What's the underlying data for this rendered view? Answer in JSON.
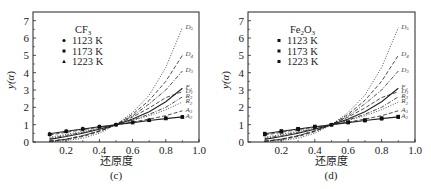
{
  "chart_data": [
    {
      "type": "line",
      "panel": "(c)",
      "legend_title": "CF3",
      "legend_title_main": "CF",
      "legend_title_sub": "3",
      "legend": [
        {
          "label": "1123 K",
          "marker": "circle"
        },
        {
          "label": "1173 K",
          "marker": "square"
        },
        {
          "label": "1223 K",
          "marker": "triangle"
        }
      ],
      "xlabel": "还原度",
      "ylabel": "y(α)",
      "xlim": [
        0,
        1.0
      ],
      "ylim": [
        0,
        7
      ],
      "xticks": [
        "0.2",
        "0.4",
        "0.6",
        "0.8",
        "1.0"
      ],
      "yticks": [
        "0",
        "1",
        "2",
        "3",
        "4",
        "5",
        "6",
        "7"
      ],
      "x": [
        0.1,
        0.2,
        0.3,
        0.4,
        0.5,
        0.6,
        0.7,
        0.8,
        0.9
      ],
      "series": [
        {
          "name": "D5",
          "label_main": "D",
          "label_sub": "5",
          "style": "dot",
          "values": [
            0.02,
            0.08,
            0.22,
            0.5,
            1.0,
            1.7,
            2.7,
            4.3,
            6.6
          ]
        },
        {
          "name": "D4",
          "label_main": "D",
          "label_sub": "4",
          "style": "dash",
          "values": [
            0.04,
            0.14,
            0.32,
            0.6,
            1.0,
            1.6,
            2.4,
            3.5,
            5.0
          ]
        },
        {
          "name": "D3",
          "label_main": "D",
          "label_sub": "3",
          "style": "dashdot",
          "values": [
            0.05,
            0.17,
            0.37,
            0.64,
            1.0,
            1.5,
            2.2,
            3.0,
            4.1
          ]
        },
        {
          "name": "F1",
          "label_main": "F",
          "label_sub": "1",
          "style": "solid",
          "values": [
            0.15,
            0.32,
            0.51,
            0.74,
            1.0,
            1.32,
            1.74,
            2.32,
            3.1
          ]
        },
        {
          "name": "D1",
          "label_main": "D",
          "label_sub": "1",
          "style": "dash",
          "values": [
            0.04,
            0.16,
            0.36,
            0.64,
            1.0,
            1.44,
            1.96,
            2.56,
            2.9
          ]
        },
        {
          "name": "R3",
          "label_main": "R",
          "label_sub": "3",
          "style": "dashdot",
          "values": [
            0.2,
            0.38,
            0.56,
            0.77,
            1.0,
            1.27,
            1.6,
            2.0,
            2.6
          ]
        },
        {
          "name": "R2",
          "label_main": "R",
          "label_sub": "2",
          "style": "dot",
          "values": [
            0.27,
            0.44,
            0.61,
            0.8,
            1.0,
            1.24,
            1.52,
            1.86,
            2.3
          ]
        },
        {
          "name": "A3",
          "label_main": "A",
          "label_sub": "3",
          "style": "dash",
          "values": [
            0.4,
            0.56,
            0.71,
            0.86,
            1.0,
            1.15,
            1.32,
            1.52,
            1.8
          ]
        },
        {
          "name": "A2",
          "label_main": "A",
          "label_sub": "2",
          "style": "solid",
          "values": [
            0.48,
            0.62,
            0.75,
            0.88,
            1.0,
            1.12,
            1.24,
            1.35,
            1.45
          ]
        }
      ],
      "experimental": [
        {
          "name": "1123 K",
          "values": [
            0.42,
            0.6,
            0.74,
            0.88,
            1.0,
            1.14,
            1.26,
            1.38,
            1.46
          ]
        },
        {
          "name": "1173 K",
          "values": [
            0.45,
            0.62,
            0.76,
            0.89,
            1.0,
            1.13,
            1.25,
            1.37,
            1.45
          ]
        },
        {
          "name": "1223 K",
          "values": [
            0.48,
            0.64,
            0.78,
            0.9,
            1.0,
            1.12,
            1.24,
            1.35,
            1.44
          ]
        }
      ],
      "grid": false,
      "legend_position": "upper left"
    },
    {
      "type": "line",
      "panel": "(d)",
      "legend_title": "Fe2O3",
      "legend_title_main": "Fe",
      "legend_title_sub": "2",
      "legend_title_main2": "O",
      "legend_title_sub2": "3",
      "legend": [
        {
          "label": "1123 K",
          "marker": "square"
        },
        {
          "label": "1173 K",
          "marker": "square"
        },
        {
          "label": "1223 K",
          "marker": "square"
        }
      ],
      "xlabel": "还原度",
      "ylabel": "y(α)",
      "xlim": [
        0,
        1.0
      ],
      "ylim": [
        0,
        7
      ],
      "xticks": [
        "0.2",
        "0.4",
        "0.6",
        "0.8",
        "1.0"
      ],
      "yticks": [
        "0",
        "1",
        "2",
        "3",
        "4",
        "5",
        "6",
        "7"
      ],
      "x": [
        0.1,
        0.2,
        0.3,
        0.4,
        0.5,
        0.6,
        0.7,
        0.8,
        0.9
      ],
      "series": [
        {
          "name": "D5",
          "label_main": "D",
          "label_sub": "5",
          "style": "dot",
          "values": [
            0.02,
            0.08,
            0.22,
            0.5,
            1.0,
            1.7,
            2.7,
            4.3,
            6.6
          ]
        },
        {
          "name": "D4",
          "label_main": "D",
          "label_sub": "4",
          "style": "dash",
          "values": [
            0.04,
            0.14,
            0.32,
            0.6,
            1.0,
            1.6,
            2.4,
            3.5,
            5.0
          ]
        },
        {
          "name": "D3",
          "label_main": "D",
          "label_sub": "3",
          "style": "dashdot",
          "values": [
            0.05,
            0.17,
            0.37,
            0.64,
            1.0,
            1.5,
            2.2,
            3.0,
            4.1
          ]
        },
        {
          "name": "F1",
          "label_main": "F",
          "label_sub": "1",
          "style": "solid",
          "values": [
            0.15,
            0.32,
            0.51,
            0.74,
            1.0,
            1.32,
            1.74,
            2.32,
            3.1
          ]
        },
        {
          "name": "D1",
          "label_main": "D",
          "label_sub": "1",
          "style": "dash",
          "values": [
            0.04,
            0.16,
            0.36,
            0.64,
            1.0,
            1.44,
            1.96,
            2.56,
            2.9
          ]
        },
        {
          "name": "R3",
          "label_main": "R",
          "label_sub": "3",
          "style": "dashdot",
          "values": [
            0.2,
            0.38,
            0.56,
            0.77,
            1.0,
            1.27,
            1.6,
            2.0,
            2.6
          ]
        },
        {
          "name": "R2",
          "label_main": "R",
          "label_sub": "2",
          "style": "dot",
          "values": [
            0.27,
            0.44,
            0.61,
            0.8,
            1.0,
            1.24,
            1.52,
            1.86,
            2.3
          ]
        },
        {
          "name": "A3",
          "label_main": "A",
          "label_sub": "3",
          "style": "dash",
          "values": [
            0.4,
            0.56,
            0.71,
            0.86,
            1.0,
            1.15,
            1.32,
            1.52,
            1.8
          ]
        },
        {
          "name": "A2",
          "label_main": "A",
          "label_sub": "2",
          "style": "solid",
          "values": [
            0.48,
            0.62,
            0.75,
            0.88,
            1.0,
            1.12,
            1.24,
            1.35,
            1.45
          ]
        }
      ],
      "experimental": [
        {
          "name": "1123 K",
          "values": [
            0.43,
            0.58,
            0.73,
            0.87,
            1.0,
            1.14,
            1.27,
            1.38,
            1.47
          ]
        },
        {
          "name": "1173 K",
          "values": [
            0.46,
            0.61,
            0.75,
            0.88,
            1.0,
            1.13,
            1.25,
            1.36,
            1.45
          ]
        },
        {
          "name": "1223 K",
          "values": [
            0.49,
            0.64,
            0.77,
            0.9,
            1.0,
            1.12,
            1.23,
            1.34,
            1.43
          ]
        }
      ],
      "grid": false,
      "legend_position": "upper left"
    }
  ],
  "panels": [
    {
      "id": "c",
      "caption": "(c)",
      "xlabel": "还原度",
      "ylabel_main": "y(",
      "ylabel_alpha": "α",
      "ylabel_close": ")"
    },
    {
      "id": "d",
      "caption": "(d)",
      "xlabel": "还原度",
      "ylabel_main": "y(",
      "ylabel_alpha": "α",
      "ylabel_close": ")"
    }
  ]
}
